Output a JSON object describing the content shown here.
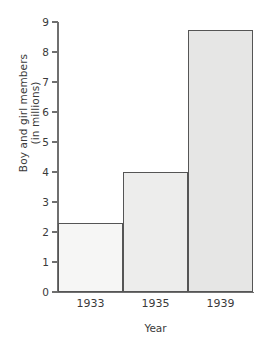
{
  "chart_data": {
    "type": "bar",
    "title": "",
    "categories": [
      "1933",
      "1935",
      "1939"
    ],
    "values": [
      2.3,
      4.0,
      8.75
    ],
    "series": [
      {
        "name": "Boy and girl members",
        "values": [
          2.3,
          4.0,
          8.75
        ]
      }
    ],
    "xlabel": "Year",
    "ylabel_line1": "Boy and girl members",
    "ylabel_line2": "(in millions)",
    "ylabel": "Boy and girl members (in millions)",
    "ylim": [
      0,
      9
    ],
    "yticks": [
      "0",
      "1",
      "2",
      "3",
      "4",
      "5",
      "6",
      "7",
      "8",
      "9"
    ],
    "grid": false,
    "legend": false,
    "bar_colors": [
      "#f6f6f5",
      "#ededec",
      "#e6e6e5"
    ],
    "bar_border_color": "#555555",
    "axis_color": "#6f6f6f",
    "text_color": "#3a3a3a",
    "background": "#ffffff"
  }
}
